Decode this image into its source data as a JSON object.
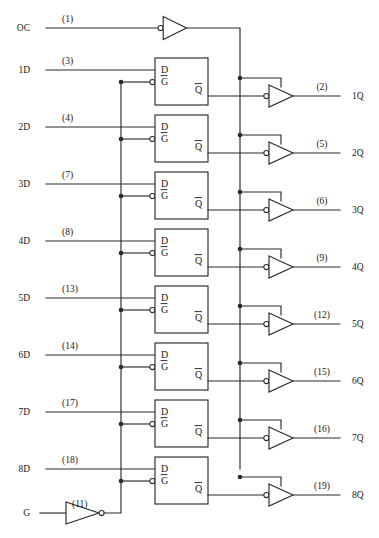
{
  "diagram": {
    "type": "logic-diagram",
    "line_color": "#2b2b2b",
    "background": "#ffffff"
  },
  "control": {
    "output_enable": {
      "label": "OC",
      "pin": "(1)",
      "gate": "inverting-buffer",
      "bubble": "input"
    },
    "gate_enable": {
      "label": "G",
      "pin": "(11)",
      "gate": "inverter",
      "bubble": "output"
    }
  },
  "latch": {
    "d_label": "D",
    "g_label": "G",
    "g_overbar": true,
    "q_label": "Q",
    "q_overbar": true
  },
  "channels": [
    {
      "index": 1,
      "d_label": "1D",
      "d_pin": "(3)",
      "q_label": "1Q",
      "q_pin": "(2)"
    },
    {
      "index": 2,
      "d_label": "2D",
      "d_pin": "(4)",
      "q_label": "2Q",
      "q_pin": "(5)"
    },
    {
      "index": 3,
      "d_label": "3D",
      "d_pin": "(7)",
      "q_label": "3Q",
      "q_pin": "(6)"
    },
    {
      "index": 4,
      "d_label": "4D",
      "d_pin": "(8)",
      "q_label": "4Q",
      "q_pin": "(9)"
    },
    {
      "index": 5,
      "d_label": "5D",
      "d_pin": "(13)",
      "q_label": "5Q",
      "q_pin": "(12)"
    },
    {
      "index": 6,
      "d_label": "6D",
      "d_pin": "(14)",
      "q_label": "6Q",
      "q_pin": "(15)"
    },
    {
      "index": 7,
      "d_label": "7D",
      "d_pin": "(17)",
      "q_label": "7Q",
      "q_pin": "(16)"
    },
    {
      "index": 8,
      "d_label": "8D",
      "d_pin": "(18)",
      "q_label": "8Q",
      "q_pin": "(19)"
    }
  ],
  "geometry": {
    "row_y": [
      70,
      127,
      184,
      241,
      298,
      355,
      412,
      469
    ],
    "box_x": 155,
    "box_w": 53,
    "box_h": 47,
    "g_bus_x": 121,
    "oc_bus_x": 240,
    "buf_x": 269,
    "buf_w": 24,
    "buf_h": 22,
    "oc_y": 28,
    "g_y": 513,
    "d_label_x": 30,
    "q_label_x": 352,
    "pin_in_x": 62,
    "pin_out_x": 322
  }
}
